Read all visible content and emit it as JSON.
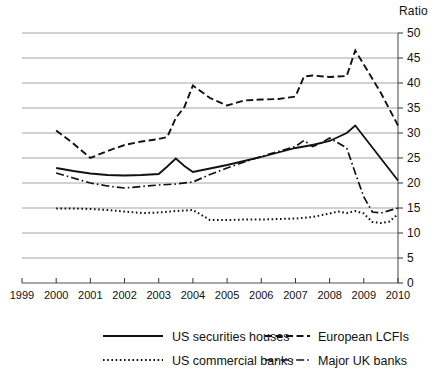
{
  "chart_data": {
    "type": "line",
    "title": "",
    "xlabel": "",
    "ylabel": "Ratio",
    "ylim": [
      0,
      50
    ],
    "xlim": [
      1999,
      2010
    ],
    "grid": true,
    "legend_position": "bottom",
    "y_ticks": [
      0,
      5,
      10,
      15,
      20,
      25,
      30,
      35,
      40,
      45,
      50
    ],
    "x_ticks": [
      1999,
      2000,
      2001,
      2002,
      2003,
      2004,
      2005,
      2006,
      2007,
      2008,
      2009,
      2010
    ],
    "series": [
      {
        "name": "US securities houses",
        "style": "solid",
        "x": [
          2000,
          2000.5,
          2001,
          2001.5,
          2002,
          2002.5,
          2003,
          2003.25,
          2003.5,
          2003.75,
          2004,
          2004.5,
          2005,
          2005.5,
          2006,
          2006.5,
          2007,
          2007.5,
          2008,
          2008.5,
          2008.75,
          2010
        ],
        "values": [
          23.0,
          22.4,
          21.9,
          21.6,
          21.5,
          21.6,
          21.8,
          23.3,
          24.9,
          23.4,
          22.2,
          22.9,
          23.6,
          24.4,
          25.2,
          26.1,
          27.0,
          27.6,
          28.4,
          30.0,
          31.5,
          20.5
        ]
      },
      {
        "name": "European LCFIs",
        "style": "dashed",
        "x": [
          2000,
          2000.5,
          2001,
          2001.5,
          2002,
          2002.5,
          2003,
          2003.25,
          2003.5,
          2003.75,
          2004,
          2004.5,
          2005,
          2005.5,
          2006,
          2006.5,
          2007,
          2007.25,
          2007.5,
          2008,
          2008.5,
          2008.75,
          2009.5,
          2010
        ],
        "values": [
          30.5,
          27.9,
          25.0,
          26.4,
          27.6,
          28.3,
          28.8,
          29.2,
          33.0,
          35.2,
          39.5,
          37.0,
          35.5,
          36.5,
          36.7,
          36.8,
          37.3,
          41.3,
          41.5,
          41.2,
          41.4,
          46.5,
          38.0,
          31.5
        ]
      },
      {
        "name": "US commercial banks",
        "style": "dotted",
        "x": [
          2000,
          2000.5,
          2001,
          2001.5,
          2002,
          2002.5,
          2003,
          2003.5,
          2004,
          2004.25,
          2004.5,
          2005,
          2005.5,
          2006,
          2006.5,
          2007,
          2007.5,
          2008,
          2008.25,
          2008.5,
          2008.75,
          2009,
          2009.25,
          2009.5,
          2009.75,
          2010
        ],
        "values": [
          14.9,
          14.9,
          14.8,
          14.6,
          14.3,
          14.0,
          14.1,
          14.4,
          14.6,
          13.6,
          12.6,
          12.6,
          12.7,
          12.7,
          12.8,
          12.9,
          13.2,
          13.9,
          14.3,
          14.0,
          14.4,
          13.9,
          12.2,
          12.0,
          12.3,
          13.8
        ]
      },
      {
        "name": "Major UK banks",
        "style": "dashdot",
        "x": [
          2000,
          2000.5,
          2001,
          2001.5,
          2002,
          2002.5,
          2003,
          2003.5,
          2004,
          2004.5,
          2005,
          2005.5,
          2006,
          2006.5,
          2007,
          2007.25,
          2007.5,
          2007.75,
          2008,
          2008.5,
          2008.75,
          2009,
          2009.25,
          2009.5,
          2010
        ],
        "values": [
          22.0,
          21.0,
          20.0,
          19.4,
          19.0,
          19.3,
          19.6,
          19.8,
          20.2,
          21.7,
          23.0,
          24.2,
          25.3,
          26.3,
          27.3,
          28.5,
          27.3,
          28.0,
          29.0,
          27.0,
          22.0,
          17.2,
          14.2,
          14.0,
          15.0
        ]
      }
    ]
  },
  "legend": {
    "items": [
      {
        "label": "US securities houses",
        "style": "solid"
      },
      {
        "label": "European LCFIs",
        "style": "dashed"
      },
      {
        "label": "US commercial banks",
        "style": "dotted"
      },
      {
        "label": "Major UK banks",
        "style": "dashdot"
      }
    ]
  }
}
